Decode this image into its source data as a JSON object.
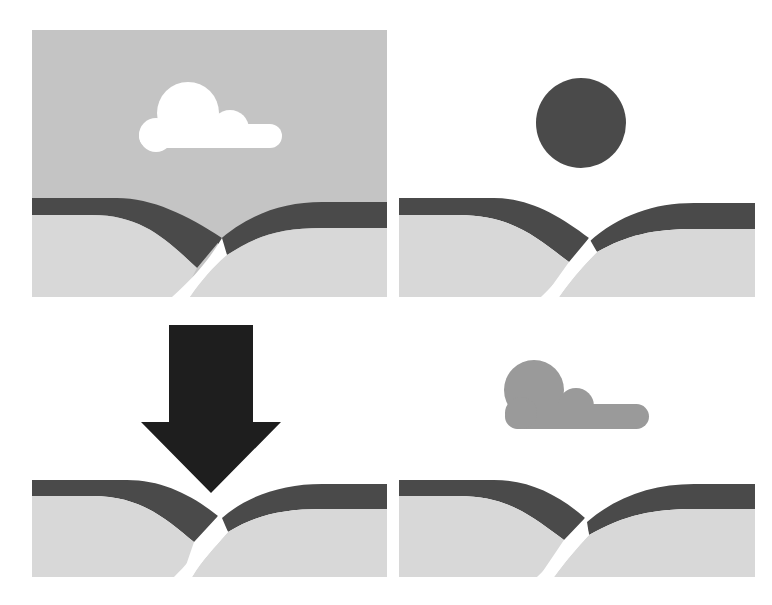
{
  "figure": {
    "colors": {
      "background": "#ffffff",
      "sky_overcast": "#c4c4c4",
      "sky_clear": "#ffffff",
      "hill_band": "#4a4a4a",
      "ground": "#d8d8d8",
      "path": "#ffffff",
      "cloud_white": "#ffffff",
      "cloud_grey": "#9a9a9a",
      "sun": "#4a4a4a",
      "arrow": "#1e1e1e"
    },
    "panels": [
      {
        "id": "panel-1",
        "position": "top-left",
        "sky": "overcast grey sky",
        "element": "white-cloud",
        "label": "Grey sky with white cloud over hills"
      },
      {
        "id": "panel-2",
        "position": "top-right",
        "sky": "clear white sky",
        "element": "sun",
        "label": "Clear sky with dark sun over hills"
      },
      {
        "id": "panel-3",
        "position": "bottom-left",
        "sky": "clear white sky",
        "element": "down-arrow",
        "label": "Large downward arrow pointing at the gap between hills"
      },
      {
        "id": "panel-4",
        "position": "bottom-right",
        "sky": "clear white sky",
        "element": "grey-cloud",
        "label": "Clear sky with grey cloud over hills"
      }
    ]
  }
}
